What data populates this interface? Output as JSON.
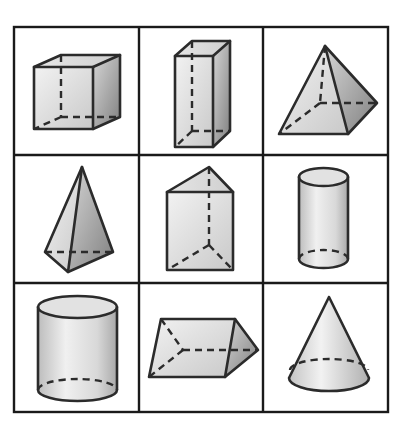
{
  "figure": {
    "rows": 3,
    "columns": 3,
    "colors": {
      "edge": "#2b2b2b",
      "grid": "#1a1a1a",
      "face_light": "#ececec",
      "face_mid": "#d0d0d0",
      "face_dark": "#8f8f8f",
      "background": "#ffffff"
    },
    "cells": [
      {
        "row": 1,
        "col": 1,
        "shape": "cube"
      },
      {
        "row": 1,
        "col": 2,
        "shape": "rectangular-prism"
      },
      {
        "row": 1,
        "col": 3,
        "shape": "square-pyramid"
      },
      {
        "row": 2,
        "col": 1,
        "shape": "triangular-pyramid"
      },
      {
        "row": 2,
        "col": 2,
        "shape": "triangular-prism-upright"
      },
      {
        "row": 2,
        "col": 3,
        "shape": "cylinder-narrow"
      },
      {
        "row": 3,
        "col": 1,
        "shape": "cylinder-wide"
      },
      {
        "row": 3,
        "col": 2,
        "shape": "triangular-prism-lying"
      },
      {
        "row": 3,
        "col": 3,
        "shape": "cone"
      }
    ]
  }
}
